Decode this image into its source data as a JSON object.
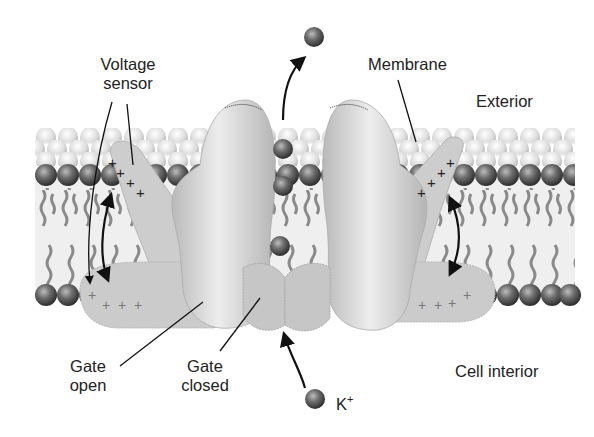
{
  "diagram": {
    "labels": {
      "voltage_sensor_line1": "Voltage",
      "voltage_sensor_line2": "sensor",
      "membrane": "Membrane",
      "exterior": "Exterior",
      "gate_open_line1": "Gate",
      "gate_open_line2": "open",
      "gate_closed_line1": "Gate",
      "gate_closed_line2": "closed",
      "cell_interior": "Cell interior",
      "ion_symbol": "K",
      "ion_charge": "+"
    },
    "sensor_charges": {
      "left_upper": [
        "+",
        "+",
        "+",
        "+"
      ],
      "left_lower": [
        "+",
        "+",
        "+",
        "+"
      ],
      "right_upper": [
        "+",
        "+",
        "+",
        "+"
      ],
      "right_lower": [
        "+",
        "+",
        "+",
        "+"
      ]
    },
    "ions_in_pore": 3,
    "colors": {
      "background": "#ffffff",
      "protein": "#c8c8c8",
      "headgroup_outer": "#d9d9d9",
      "headgroup_dark": "#555555",
      "lipid_tail": "#8a8a8a",
      "text": "#222222",
      "arrow": "#111111"
    }
  }
}
